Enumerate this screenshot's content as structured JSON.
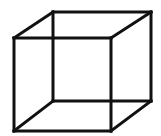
{
  "figure": {
    "name": "Necker cube",
    "type": "wireframe-cube-illusion",
    "width": 161,
    "height": 136,
    "background_color": "#ffffff",
    "line_color": "#111111",
    "line_width": 3,
    "vertices": {
      "front_top_left": [
        14,
        38
      ],
      "front_top_right": [
        111,
        38
      ],
      "front_bottom_right": [
        111,
        131
      ],
      "front_bottom_left": [
        14,
        131
      ],
      "back_top_left": [
        53,
        12
      ],
      "back_top_right": [
        151,
        12
      ],
      "back_bottom_right": [
        151,
        101
      ],
      "back_bottom_left": [
        53,
        101
      ]
    },
    "edges": [
      {
        "id": "front-top",
        "from": "front_top_left",
        "to": "front_top_right"
      },
      {
        "id": "front-right",
        "from": "front_top_right",
        "to": "front_bottom_right"
      },
      {
        "id": "front-bottom",
        "from": "front_bottom_right",
        "to": "front_bottom_left"
      },
      {
        "id": "front-left",
        "from": "front_bottom_left",
        "to": "front_top_left"
      },
      {
        "id": "back-top",
        "from": "back_top_left",
        "to": "back_top_right"
      },
      {
        "id": "back-right",
        "from": "back_top_right",
        "to": "back_bottom_right"
      },
      {
        "id": "back-bottom",
        "from": "back_bottom_right",
        "to": "back_bottom_left"
      },
      {
        "id": "back-left",
        "from": "back_bottom_left",
        "to": "back_top_left"
      },
      {
        "id": "connector-top-left",
        "from": "front_top_left",
        "to": "back_top_left"
      },
      {
        "id": "connector-top-right",
        "from": "front_top_right",
        "to": "back_top_right"
      },
      {
        "id": "connector-bottom-right",
        "from": "front_bottom_right",
        "to": "back_bottom_right"
      },
      {
        "id": "connector-bottom-left",
        "from": "front_bottom_left",
        "to": "back_bottom_left"
      }
    ]
  }
}
